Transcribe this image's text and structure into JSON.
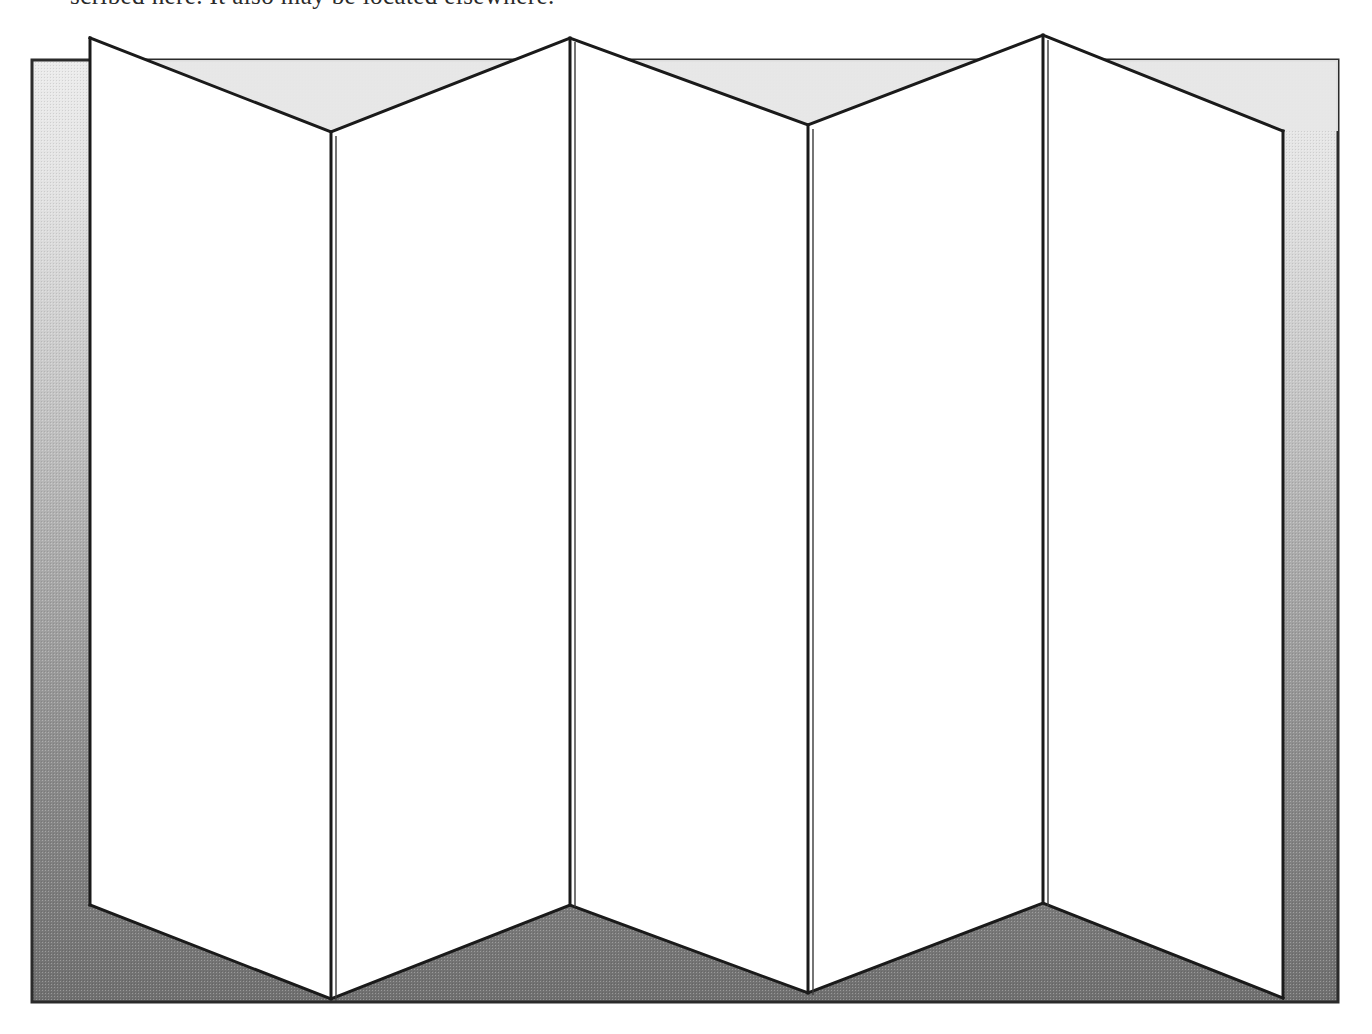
{
  "document": {
    "caption_clipped": "scribed here. It also may be located elsewhere."
  },
  "figure": {
    "type": "patent-line-drawing",
    "panel_count": 6,
    "colors": {
      "background_top": "#e9e9e9",
      "background_bottom": "#6e6e6e",
      "panel_face_light": "#ffffff",
      "panel_face_shaded": "#e8e8e8",
      "outline": "#1a1a1a",
      "page": "#ffffff"
    },
    "background_rect": {
      "x": 32,
      "y": 60,
      "width": 1306,
      "height": 942
    },
    "fold_lines_x": [
      90,
      331,
      570,
      808,
      1043,
      1283
    ],
    "top_vertices": [
      {
        "x": 90,
        "y": 38,
        "kind": "peak"
      },
      {
        "x": 331,
        "y": 132,
        "kind": "valley"
      },
      {
        "x": 570,
        "y": 38,
        "kind": "peak"
      },
      {
        "x": 808,
        "y": 125,
        "kind": "valley"
      },
      {
        "x": 1043,
        "y": 35,
        "kind": "peak"
      },
      {
        "x": 1283,
        "y": 131,
        "kind": "valley"
      }
    ],
    "bottom_vertices": [
      {
        "x": 90,
        "y": 905,
        "kind": "peak"
      },
      {
        "x": 331,
        "y": 999,
        "kind": "valley"
      },
      {
        "x": 570,
        "y": 905,
        "kind": "peak"
      },
      {
        "x": 808,
        "y": 993,
        "kind": "valley"
      },
      {
        "x": 1043,
        "y": 903,
        "kind": "peak"
      },
      {
        "x": 1283,
        "y": 998,
        "kind": "valley"
      }
    ],
    "panels": [
      {
        "index": 1,
        "left_x": 90,
        "right_x": 331,
        "face": "light"
      },
      {
        "index": 2,
        "left_x": 331,
        "right_x": 570,
        "face": "light"
      },
      {
        "index": 3,
        "left_x": 570,
        "right_x": 808,
        "face": "light"
      },
      {
        "index": 4,
        "left_x": 808,
        "right_x": 1043,
        "face": "light"
      },
      {
        "index": 5,
        "left_x": 1043,
        "right_x": 1283,
        "face": "light"
      }
    ]
  }
}
